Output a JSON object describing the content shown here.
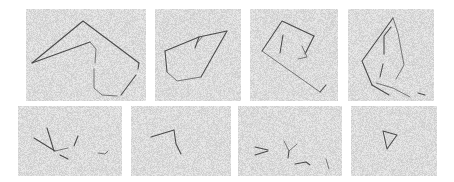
{
  "figure": {
    "background_color": "#ffffff",
    "panel_background_color": "#d6d6d6",
    "stroke_color": "#4a4a4a",
    "rows": 2,
    "columns": 4,
    "panel_count": 8
  },
  "panels": [
    {
      "id": "panel-1",
      "row": 1,
      "column": 1,
      "label": "closed angular polygon with inner spur",
      "x": 26,
      "y": 9,
      "width": 120,
      "height": 92,
      "viewbox": "0 0 120 92",
      "paths": [
        "M 6 54 L 57 12 L 113 54",
        "M 6 54 L 64 33",
        "M 64 33 L 70 40 L 69 54",
        "M 113 54 L 112 60",
        "M 110 66 L 95 86",
        "M 68 60 L 68 79 L 76 86 L 91 87"
      ]
    },
    {
      "id": "panel-2",
      "row": 1,
      "column": 2,
      "label": "closed quadrilateral with short internal tick",
      "x": 155,
      "y": 9,
      "width": 86,
      "height": 92,
      "viewbox": "0 0 86 92",
      "paths": [
        "M 10 42 L 44 28 L 72 22",
        "M 72 22 L 46 68",
        "M 46 68 L 22 72 L 12 63",
        "M 12 63 L 10 42",
        "M 44 28 L 40 39",
        "M 48 27 L 42 34"
      ]
    },
    {
      "id": "panel-3",
      "row": 1,
      "column": 3,
      "label": "tilted rectangle with two internal strokes",
      "x": 250,
      "y": 9,
      "width": 88,
      "height": 92,
      "viewbox": "0 0 88 92",
      "paths": [
        "M 12 42 L 32 12 L 64 27",
        "M 64 27 L 55 45",
        "M 12 42 L 70 83",
        "M 70 83 L 76 76",
        "M 33 26 L 30 44",
        "M 52 37 L 57 48 L 48 50"
      ]
    },
    {
      "id": "panel-4",
      "row": 1,
      "column": 4,
      "label": "elongated diamond with inner fragments",
      "x": 348,
      "y": 9,
      "width": 86,
      "height": 92,
      "viewbox": "0 0 86 92",
      "paths": [
        "M 45 9 L 14 52 L 24 76",
        "M 24 76 L 41 86",
        "M 45 9 L 50 24 L 56 56 L 48 70",
        "M 43 18 L 36 27 L 36 45",
        "M 35 55 L 32 68",
        "M 28 74 L 45 79 L 62 88",
        "M 70 84 L 77 86"
      ]
    },
    {
      "id": "panel-5",
      "row": 2,
      "column": 1,
      "label": "scattered converging short strokes",
      "x": 18,
      "y": 106,
      "width": 104,
      "height": 70,
      "viewbox": "0 0 104 70",
      "paths": [
        "M 29 22 L 36 45",
        "M 16 32 L 37 45",
        "M 37 45 L 50 42",
        "M 42 49 L 50 53",
        "M 60 30 L 56 40",
        "M 80 47 L 87 48 L 90 45"
      ]
    },
    {
      "id": "panel-6",
      "row": 2,
      "column": 2,
      "label": "single bent elbow stroke",
      "x": 131,
      "y": 106,
      "width": 100,
      "height": 70,
      "viewbox": "0 0 100 70",
      "paths": [
        "M 20 31 L 43 24",
        "M 43 24 L 45 38 L 50 48"
      ]
    },
    {
      "id": "panel-7",
      "row": 2,
      "column": 3,
      "label": "sparse scattered fragments",
      "x": 238,
      "y": 106,
      "width": 104,
      "height": 70,
      "viewbox": "0 0 104 70",
      "paths": [
        "M 17 41 L 30 44",
        "M 17 49 L 30 45",
        "M 46 35 L 51 45 L 59 38",
        "M 51 45 L 50 52",
        "M 57 58 L 68 56 L 72 59",
        "M 88 53 L 91 63"
      ]
    },
    {
      "id": "panel-8",
      "row": 2,
      "column": 4,
      "label": "small closed triangle",
      "x": 351,
      "y": 106,
      "width": 86,
      "height": 70,
      "viewbox": "0 0 86 70",
      "paths": [
        "M 32 25 L 46 29 L 36 43 L 32 25"
      ]
    }
  ]
}
